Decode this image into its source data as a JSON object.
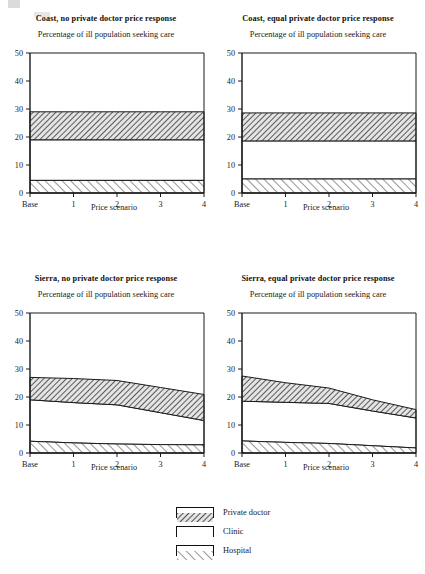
{
  "figure": {
    "subtitle_common": "Percentage of ill population seeking care",
    "xlabel_common": "Price scenario"
  },
  "legend": {
    "items": [
      {
        "label": "Private doctor",
        "pattern": "dense-backhatch-gray",
        "swatch_name": "legend-swatch-private-doctor"
      },
      {
        "label": "Clinic",
        "pattern": "empty-white",
        "swatch_name": "legend-swatch-clinic"
      },
      {
        "label": "Hospital",
        "pattern": "sparse-forwardhatch",
        "swatch_name": "legend-swatch-hospital"
      }
    ]
  },
  "chart_data": [
    {
      "type": "area",
      "id": "coast-no-response",
      "title": "Coast, no private doctor price response",
      "subtitle": "Percentage of ill population seeking care",
      "xlabel": "Price scenario",
      "ylabel": "",
      "categories": [
        "Base",
        "1",
        "2",
        "3",
        "4"
      ],
      "x": [
        0,
        1,
        2,
        3,
        4
      ],
      "xticklabels": [
        "Base",
        "1",
        "2",
        "3",
        "4"
      ],
      "yticks": [
        0,
        10,
        20,
        30,
        40,
        50
      ],
      "ylim": [
        0,
        50
      ],
      "xlim": [
        0,
        4
      ],
      "grid": false,
      "stacked": true,
      "series": [
        {
          "name": "Hospital",
          "values": [
            4.5,
            4.5,
            4.5,
            4.5,
            4.5
          ]
        },
        {
          "name": "Clinic",
          "values": [
            14.5,
            14.5,
            14.5,
            14.5,
            14.5
          ]
        },
        {
          "name": "Private doctor",
          "values": [
            10.0,
            10.0,
            10.0,
            10.0,
            10.0
          ]
        }
      ],
      "cumulative_boundaries": {
        "hospital_top": [
          4.5,
          4.5,
          4.5,
          4.5,
          4.5
        ],
        "clinic_top": [
          19.0,
          19.0,
          19.0,
          19.0,
          19.0
        ],
        "private_doctor_top": [
          29.0,
          29.0,
          29.0,
          29.0,
          29.0
        ]
      }
    },
    {
      "type": "area",
      "id": "coast-equal-response",
      "title": "Coast, equal private doctor price response",
      "subtitle": "Percentage of ill population seeking care",
      "xlabel": "Price scenario",
      "ylabel": "",
      "categories": [
        "Base",
        "1",
        "2",
        "3",
        "4"
      ],
      "x": [
        0,
        1,
        2,
        3,
        4
      ],
      "xticklabels": [
        "Base",
        "1",
        "2",
        "3",
        "4"
      ],
      "yticks": [
        0,
        10,
        20,
        30,
        40,
        50
      ],
      "ylim": [
        0,
        50
      ],
      "xlim": [
        0,
        4
      ],
      "grid": false,
      "stacked": true,
      "series": [
        {
          "name": "Hospital",
          "values": [
            5.0,
            5.0,
            5.0,
            5.0,
            5.0
          ]
        },
        {
          "name": "Clinic",
          "values": [
            13.6,
            13.6,
            13.6,
            13.6,
            13.6
          ]
        },
        {
          "name": "Private doctor",
          "values": [
            10.0,
            10.0,
            10.0,
            10.0,
            10.0
          ]
        }
      ],
      "cumulative_boundaries": {
        "hospital_top": [
          5.0,
          5.0,
          5.0,
          5.0,
          5.0
        ],
        "clinic_top": [
          18.6,
          18.6,
          18.6,
          18.6,
          18.6
        ],
        "private_doctor_top": [
          28.6,
          28.6,
          28.6,
          28.6,
          28.6
        ]
      }
    },
    {
      "type": "area",
      "id": "sierra-no-response",
      "title": "Sierra, no private doctor price response",
      "subtitle": "Percentage of ill population seeking care",
      "xlabel": "Price scenario",
      "ylabel": "",
      "categories": [
        "Base",
        "1",
        "2",
        "3",
        "4"
      ],
      "x": [
        0,
        1,
        2,
        3,
        4
      ],
      "xticklabels": [
        "Base",
        "1",
        "2",
        "3",
        "4"
      ],
      "yticks": [
        0,
        10,
        20,
        30,
        40,
        50
      ],
      "ylim": [
        0,
        50
      ],
      "xlim": [
        0,
        4
      ],
      "grid": false,
      "stacked": true,
      "series": [
        {
          "name": "Hospital",
          "values": [
            4.2,
            3.6,
            3.2,
            3.0,
            2.9
          ]
        },
        {
          "name": "Clinic",
          "values": [
            14.8,
            14.4,
            14.0,
            11.4,
            8.7
          ]
        },
        {
          "name": "Private doctor",
          "values": [
            8.0,
            8.6,
            8.7,
            9.0,
            9.3
          ]
        }
      ],
      "cumulative_boundaries": {
        "hospital_top": [
          4.2,
          3.6,
          3.2,
          3.0,
          2.9
        ],
        "clinic_top": [
          19.0,
          18.0,
          17.2,
          14.4,
          11.6
        ],
        "private_doctor_top": [
          27.0,
          26.6,
          25.9,
          23.4,
          20.9
        ]
      }
    },
    {
      "type": "area",
      "id": "sierra-equal-response",
      "title": "Sierra, equal private doctor price response",
      "subtitle": "Percentage of ill population seeking care",
      "xlabel": "Price scenario",
      "ylabel": "",
      "categories": [
        "Base",
        "1",
        "2",
        "3",
        "4"
      ],
      "x": [
        0,
        1,
        2,
        3,
        4
      ],
      "xticklabels": [
        "Base",
        "1",
        "2",
        "3",
        "4"
      ],
      "yticks": [
        0,
        10,
        20,
        30,
        40,
        50
      ],
      "ylim": [
        0,
        50
      ],
      "xlim": [
        0,
        4
      ],
      "grid": false,
      "stacked": true,
      "series": [
        {
          "name": "Hospital",
          "values": [
            4.3,
            3.8,
            3.4,
            2.6,
            1.8
          ]
        },
        {
          "name": "Clinic",
          "values": [
            14.2,
            14.3,
            14.3,
            12.4,
            10.7
          ]
        },
        {
          "name": "Private doctor",
          "values": [
            9.0,
            7.0,
            5.5,
            4.0,
            3.0
          ]
        }
      ],
      "cumulative_boundaries": {
        "hospital_top": [
          4.3,
          3.8,
          3.4,
          2.6,
          1.8
        ],
        "clinic_top": [
          18.5,
          18.1,
          17.7,
          15.0,
          12.5
        ],
        "private_doctor_top": [
          27.5,
          25.1,
          23.2,
          19.0,
          15.5
        ]
      }
    }
  ]
}
